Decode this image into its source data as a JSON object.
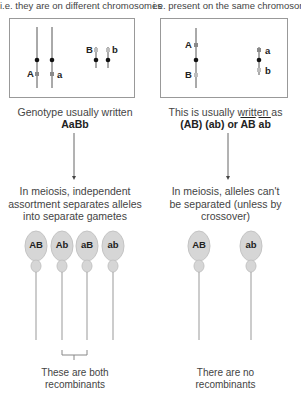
{
  "left": {
    "heading": "i.e. they are on different chromosomes",
    "chromosomes": {
      "labels": [
        "A",
        "a",
        "B",
        "b"
      ]
    },
    "genotype_caption": "Genotype usually written",
    "genotype": "AaBb",
    "meiosis_text": [
      "In meiosis, independent",
      "assortment separates alleles",
      "into separate gametes"
    ],
    "gametes": [
      "AB",
      "Ab",
      "aB",
      "ab"
    ],
    "footer": [
      "These are both",
      "recombinants"
    ]
  },
  "right": {
    "heading": "i.e. present on the same chromosome",
    "chromosomes": {
      "labels": [
        "A",
        "B",
        "a",
        "b"
      ]
    },
    "genotype_caption": "This is usually written as",
    "genotype_part1": "(AB) (ab) or ",
    "genotype_part2": "AB",
    "genotype_part3": "ab",
    "meiosis_text": [
      "In meiosis, alleles can't",
      "be separated (unless by",
      "crossover)"
    ],
    "gametes": [
      "AB",
      "ab"
    ],
    "footer": [
      "There are no",
      "recombinants"
    ]
  },
  "colors": {
    "box_border": "#999999",
    "chromosome_line": "#555555",
    "centromere": "#111111",
    "allele_dark": "#8a8a8a",
    "allele_light": "#bdbdbd",
    "gamete_fill": "#d6d6d6",
    "gamete_stroke": "#bbbbbb"
  }
}
